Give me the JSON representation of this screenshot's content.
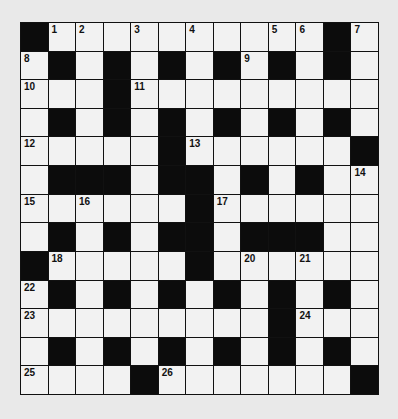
{
  "puzzle": {
    "rows": 13,
    "cols": 13,
    "grid": [
      "#..........#.",
      ".#.#.#.#.#.#.",
      "...#.........",
      ".#.#.#.#.#.#.",
      ".....#......#",
      ".###.##.#.#..",
      "......#......",
      ".#.#.##.###..",
      "#.....#......",
      ".#.#.#.#.#.#.",
      ".........#...",
      ".#.#.#.#.#.#.",
      "....#.......#"
    ],
    "numbers": [
      {
        "row": 0,
        "col": 1,
        "n": "1"
      },
      {
        "row": 0,
        "col": 2,
        "n": "2"
      },
      {
        "row": 0,
        "col": 4,
        "n": "3"
      },
      {
        "row": 0,
        "col": 6,
        "n": "4"
      },
      {
        "row": 0,
        "col": 9,
        "n": "5"
      },
      {
        "row": 0,
        "col": 10,
        "n": "6"
      },
      {
        "row": 0,
        "col": 12,
        "n": "7"
      },
      {
        "row": 1,
        "col": 0,
        "n": "8"
      },
      {
        "row": 1,
        "col": 8,
        "n": "9"
      },
      {
        "row": 2,
        "col": 0,
        "n": "10"
      },
      {
        "row": 2,
        "col": 4,
        "n": "11"
      },
      {
        "row": 4,
        "col": 0,
        "n": "12"
      },
      {
        "row": 4,
        "col": 6,
        "n": "13"
      },
      {
        "row": 5,
        "col": 12,
        "n": "14"
      },
      {
        "row": 6,
        "col": 0,
        "n": "15"
      },
      {
        "row": 6,
        "col": 2,
        "n": "16"
      },
      {
        "row": 6,
        "col": 7,
        "n": "17"
      },
      {
        "row": 8,
        "col": 1,
        "n": "18"
      },
      {
        "row": 8,
        "col": 6,
        "n": "19"
      },
      {
        "row": 8,
        "col": 8,
        "n": "20"
      },
      {
        "row": 8,
        "col": 10,
        "n": "21"
      },
      {
        "row": 9,
        "col": 0,
        "n": "22"
      },
      {
        "row": 10,
        "col": 0,
        "n": "23"
      },
      {
        "row": 10,
        "col": 10,
        "n": "24"
      },
      {
        "row": 12,
        "col": 0,
        "n": "25"
      },
      {
        "row": 12,
        "col": 5,
        "n": "26"
      }
    ],
    "colors": {
      "block": "#0c0c0c",
      "cell": "#f2f2f2",
      "background": "#e9e9e9"
    }
  }
}
